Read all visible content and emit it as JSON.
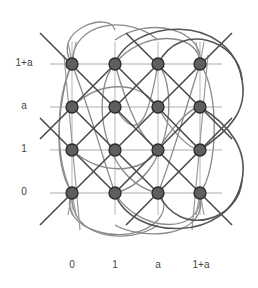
{
  "colors": {
    "grid": "#c8c8c8",
    "line_dark": "#4a4a4a",
    "curve": "#7a7a7a",
    "node_fill": "#5e5e5e",
    "node_stroke": "#2a2a2a",
    "label": "#444444"
  },
  "axes": {
    "x_labels": [
      "0",
      "1",
      "a",
      "1+a"
    ],
    "y_labels": [
      "0",
      "1",
      "a",
      "1+a"
    ]
  },
  "grid": {
    "x": [
      72,
      115,
      158,
      200
    ],
    "y": [
      193,
      150,
      107,
      64
    ]
  },
  "nodes": [
    {
      "x": "0",
      "y": "0"
    },
    {
      "x": "1",
      "y": "0"
    },
    {
      "x": "a",
      "y": "0"
    },
    {
      "x": "1+a",
      "y": "0"
    },
    {
      "x": "0",
      "y": "1"
    },
    {
      "x": "1",
      "y": "1"
    },
    {
      "x": "a",
      "y": "1"
    },
    {
      "x": "1+a",
      "y": "1"
    },
    {
      "x": "0",
      "y": "a"
    },
    {
      "x": "1",
      "y": "a"
    },
    {
      "x": "a",
      "y": "a"
    },
    {
      "x": "1+a",
      "y": "a"
    },
    {
      "x": "0",
      "y": "1+a"
    },
    {
      "x": "1",
      "y": "1+a"
    },
    {
      "x": "a",
      "y": "1+a"
    },
    {
      "x": "1+a",
      "y": "1+a"
    }
  ]
}
